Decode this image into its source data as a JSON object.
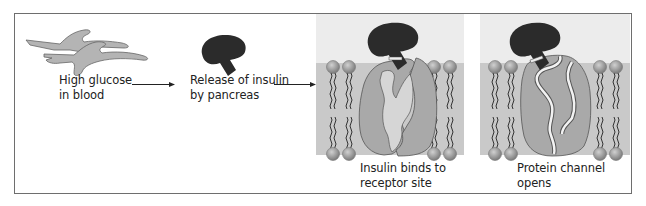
{
  "diagram": {
    "steps": [
      {
        "id": "glucose",
        "line1": "High glucose",
        "line2": "in blood"
      },
      {
        "id": "insulin-release",
        "line1": "Release of insulin",
        "line2": "by pancreas"
      },
      {
        "id": "binding",
        "line1": "Insulin binds to",
        "line2": "receptor site"
      },
      {
        "id": "channel",
        "line1": "Protein channel",
        "line2": "opens"
      }
    ],
    "arrows": [
      {
        "from": "glucose",
        "to": "insulin-release"
      },
      {
        "from": "insulin-release",
        "to": "binding"
      }
    ],
    "colors": {
      "frame": "#6e6e6e",
      "glucose_fill": "#b4b4b4",
      "insulin_fill": "#2b2b2b",
      "panel_top": "#ececec",
      "membrane": "#c9c9c9",
      "protein": "#a9a9a9",
      "protein_inner": "#d6d6d6",
      "lipid_head": "#9a9a9a"
    }
  }
}
